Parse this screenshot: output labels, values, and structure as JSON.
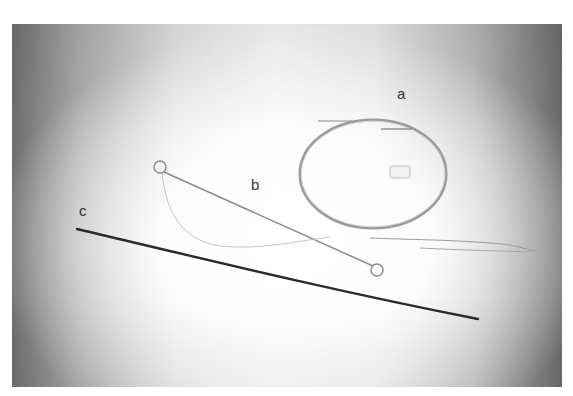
{
  "photo": {
    "subject": "medical wires and catheters on gradient background",
    "background_colors": {
      "edge_dark": "#6e6e6e",
      "center_light": "#f6f6f6"
    }
  },
  "labels": {
    "a": "a",
    "b": "b",
    "c": "c"
  },
  "items": [
    {
      "id": "a",
      "description": "coiled circular wire with small connector"
    },
    {
      "id": "b",
      "description": "straight wire with looped ends and thin trailing thread"
    },
    {
      "id": "c",
      "description": "dark straight rod"
    }
  ],
  "colors": {
    "rod_c": "#2a2a2a",
    "wire_a": "#8a8a8a",
    "wire_b": "#7a7a7a",
    "thread": "#b0b0b0"
  }
}
